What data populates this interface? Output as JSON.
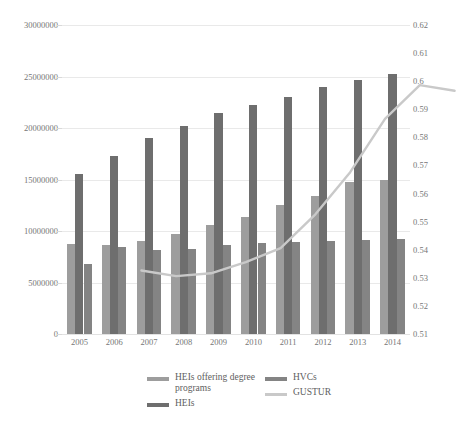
{
  "chart_data": {
    "type": "bar",
    "title": "",
    "subtitle": "",
    "xlabel": "",
    "ylabel": "",
    "y2label": "",
    "grid": true,
    "legend_position": "bottom",
    "categories": [
      "2005",
      "2006",
      "2007",
      "2008",
      "2009",
      "2010",
      "2011",
      "2012",
      "2013",
      "2014"
    ],
    "ylim": [
      0,
      30000000
    ],
    "yticks": [
      0,
      5000000,
      10000000,
      15000000,
      20000000,
      25000000,
      30000000
    ],
    "ytick_labels": [
      "0",
      "5000000",
      "10000000",
      "15000000",
      "20000000",
      "25000000",
      "30000000"
    ],
    "y2lim": [
      0.51,
      0.62
    ],
    "y2ticks": [
      0.51,
      0.52,
      0.53,
      0.54,
      0.55,
      0.56,
      0.57,
      0.58,
      0.59,
      0.6,
      0.61,
      0.62
    ],
    "y2tick_labels": [
      "0.51",
      "0.52",
      "0.53",
      "0.54",
      "0.55",
      "0.56",
      "0.57",
      "0.58",
      "0.59",
      "0.6",
      "0.61",
      "0.62"
    ],
    "series": [
      {
        "name": "HEIs offering degree programs",
        "kind": "bar",
        "axis": "left",
        "color": "#9d9d9d",
        "values": [
          8700000,
          8600000,
          9000000,
          9700000,
          10600000,
          11400000,
          12500000,
          13400000,
          14800000,
          15000000
        ]
      },
      {
        "name": "HEIs",
        "kind": "bar",
        "axis": "left",
        "color": "#6e6e6e",
        "values": [
          15500000,
          17300000,
          19000000,
          20200000,
          21500000,
          22200000,
          23000000,
          24000000,
          24700000,
          25200000
        ]
      },
      {
        "name": "HVCs",
        "kind": "bar",
        "axis": "left",
        "color": "#848484",
        "values": [
          6800000,
          8400000,
          8200000,
          8300000,
          8600000,
          8800000,
          8900000,
          9000000,
          9100000,
          9200000
        ]
      },
      {
        "name": "GUSTUR",
        "kind": "line",
        "axis": "right",
        "color": "#c9c9c9",
        "values": [
          0.5415,
          0.5395,
          0.5405,
          0.5445,
          0.5495,
          0.5615,
          0.5765,
          0.5955,
          0.6075,
          0.6055
        ]
      }
    ]
  },
  "legend": {
    "entries": [
      {
        "label": "HEIs offering degree programs",
        "swatch": "s0",
        "column": 0
      },
      {
        "label": "HEIs",
        "swatch": "s1",
        "column": 0
      },
      {
        "label": "HVCs",
        "swatch": "s2",
        "column": 1
      },
      {
        "label": "GUSTUR",
        "swatch": "line",
        "column": 1
      }
    ]
  }
}
